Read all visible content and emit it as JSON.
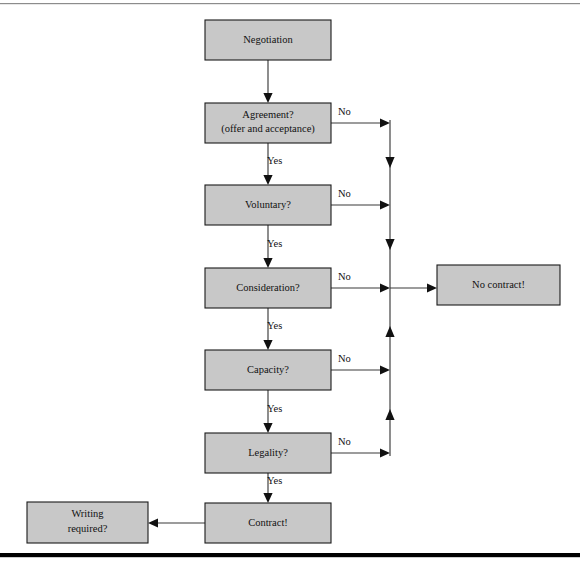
{
  "figure": {
    "background_color": "#ffffff",
    "node_fill_color": "#c8c8c8",
    "node_border_color": "#1a1a1a",
    "line_color": "#3a3a3a",
    "rules": {
      "top_rule_color": "#8c8c8c",
      "bottom_rule_color": "#000000"
    }
  },
  "nodes": [
    {
      "id": "negotiation",
      "label": "Negotiation",
      "label_line2": "",
      "x": 205,
      "y": 20,
      "w": 126,
      "h": 40
    },
    {
      "id": "agreement",
      "label": "Agreement?",
      "label_line2": "(offer and acceptance)",
      "x": 205,
      "y": 103,
      "w": 126,
      "h": 40
    },
    {
      "id": "voluntary",
      "label": "Voluntary?",
      "label_line2": "",
      "x": 205,
      "y": 185,
      "w": 126,
      "h": 40
    },
    {
      "id": "consideration",
      "label": "Consideration?",
      "label_line2": "",
      "x": 205,
      "y": 268,
      "w": 126,
      "h": 40
    },
    {
      "id": "capacity",
      "label": "Capacity?",
      "label_line2": "",
      "x": 205,
      "y": 350,
      "w": 126,
      "h": 40
    },
    {
      "id": "legality",
      "label": "Legality?",
      "label_line2": "",
      "x": 205,
      "y": 433,
      "w": 126,
      "h": 40
    },
    {
      "id": "contract",
      "label": "Contract!",
      "label_line2": "",
      "x": 205,
      "y": 503,
      "w": 126,
      "h": 40
    },
    {
      "id": "no-contract",
      "label": "No contract!",
      "label_line2": "",
      "x": 437,
      "y": 265,
      "w": 123,
      "h": 40
    },
    {
      "id": "writing",
      "label": "Writing",
      "label_line2": "required?",
      "x": 27,
      "y": 502,
      "w": 121,
      "h": 41
    }
  ],
  "edges": {
    "yes_label": "Yes",
    "no_label": "No",
    "yes_labels": [
      {
        "from": "agreement",
        "to": "voluntary",
        "text": "Yes",
        "x": 267,
        "y": 162
      },
      {
        "from": "voluntary",
        "to": "consideration",
        "text": "Yes",
        "x": 267,
        "y": 245
      },
      {
        "from": "consideration",
        "to": "capacity",
        "text": "Yes",
        "x": 267,
        "y": 327
      },
      {
        "from": "capacity",
        "to": "legality",
        "text": "Yes",
        "x": 267,
        "y": 410
      },
      {
        "from": "legality",
        "to": "contract",
        "text": "Yes",
        "x": 267,
        "y": 482
      }
    ],
    "no_labels": [
      {
        "from": "agreement",
        "text": "No",
        "x": 338,
        "y": 113
      },
      {
        "from": "voluntary",
        "text": "No",
        "x": 338,
        "y": 195
      },
      {
        "from": "consideration",
        "text": "No",
        "x": 338,
        "y": 278
      },
      {
        "from": "capacity",
        "text": "No",
        "x": 338,
        "y": 360
      },
      {
        "from": "legality",
        "text": "No",
        "x": 338,
        "y": 443
      }
    ]
  },
  "flow_description": {
    "start": "Negotiation",
    "decisions": [
      "Agreement? (offer and acceptance)",
      "Voluntary?",
      "Consideration?",
      "Capacity?",
      "Legality?"
    ],
    "yes_outcome": "Contract!",
    "no_outcome": "No contract!",
    "final_question": "Writing required?"
  }
}
